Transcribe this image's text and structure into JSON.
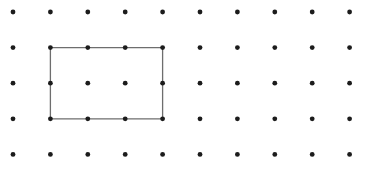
{
  "figure": {
    "background_color": "#ffffff",
    "width": 367,
    "height": 173
  },
  "grid": {
    "name": "dot-lattice",
    "columns": 10,
    "rows": 5,
    "origin_x": 13,
    "origin_y": 12,
    "spacing_x": 37.4,
    "spacing_y": 35.6,
    "dot_radius": 2.4,
    "dot_color": "#1c1c1c",
    "column_labels": [
      "0",
      "1",
      "2",
      "3",
      "4",
      "5",
      "6",
      "7",
      "8",
      "9"
    ],
    "row_labels": [
      "0",
      "1",
      "2",
      "3",
      "4"
    ]
  },
  "chart_data": {
    "type": "scatter",
    "xlabel": "",
    "ylabel": "",
    "xlim": [
      0,
      9
    ],
    "ylim": [
      0,
      4
    ],
    "grid": false,
    "legend": "none",
    "series": [
      {
        "name": "lattice-points",
        "marker": "filled-circle",
        "color": "#1c1c1c",
        "x": [
          0,
          1,
          2,
          3,
          4,
          5,
          6,
          7,
          8,
          9,
          0,
          1,
          2,
          3,
          4,
          5,
          6,
          7,
          8,
          9,
          0,
          1,
          2,
          3,
          4,
          5,
          6,
          7,
          8,
          9,
          0,
          1,
          2,
          3,
          4,
          5,
          6,
          7,
          8,
          9,
          0,
          1,
          2,
          3,
          4,
          5,
          6,
          7,
          8,
          9
        ],
        "y": [
          0,
          0,
          0,
          0,
          0,
          0,
          0,
          0,
          0,
          0,
          1,
          1,
          1,
          1,
          1,
          1,
          1,
          1,
          1,
          1,
          2,
          2,
          2,
          2,
          2,
          2,
          2,
          2,
          2,
          2,
          3,
          3,
          3,
          3,
          3,
          3,
          3,
          3,
          3,
          3,
          4,
          4,
          4,
          4,
          4,
          4,
          4,
          4,
          4,
          4
        ]
      }
    ],
    "annotations": [
      {
        "name": "rectangle",
        "type": "polygon",
        "closed": true,
        "stroke_color": "#6e6e6e",
        "stroke_width": 1.3,
        "fill": "none",
        "vertices_grid": [
          [
            1,
            1
          ],
          [
            4,
            1
          ],
          [
            4,
            3
          ],
          [
            1,
            3
          ]
        ],
        "width_units": 3,
        "height_units": 2,
        "area_units": 6,
        "perimeter_units": 10,
        "interior_points": 2,
        "boundary_points": 10
      }
    ]
  },
  "rectangle": {
    "name": "rectangle-shape",
    "stroke_color": "#6e6e6e",
    "stroke_width": 1.3,
    "left_px": 50.4,
    "top_px": 47.6,
    "right_px": 162.6,
    "bottom_px": 118.8,
    "corner_columns": [
      1,
      4
    ],
    "corner_rows": [
      1,
      3
    ]
  }
}
